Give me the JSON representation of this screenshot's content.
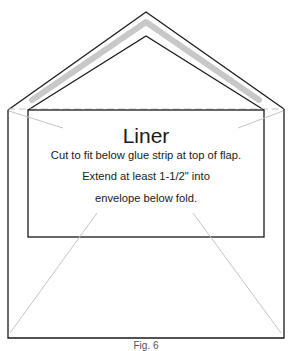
{
  "diagram": {
    "title": "Liner",
    "instructions": [
      "Cut to fit below glue strip at top of flap.",
      "Extend at least 1-1/2\" into",
      "envelope below fold."
    ],
    "caption": "Fig. 6",
    "colors": {
      "outline": "#1a1a1a",
      "glue_strip": "#c8c8c8",
      "guide_lines": "#c4c4c4",
      "fold_dashes": "#c4c4c4"
    }
  }
}
